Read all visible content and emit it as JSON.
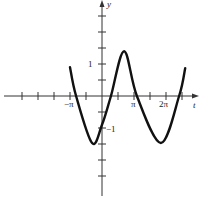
{
  "chart_data": {
    "type": "line",
    "title": "",
    "xlabel": "t",
    "ylabel": "y",
    "x_tick_labels": [
      "-π",
      "π",
      "2π"
    ],
    "y_tick_labels": [
      "1",
      "-1"
    ],
    "x_tick_step": "π/2",
    "y_tick_step": 0.5,
    "xlim_pi": [
      -3,
      3
    ],
    "ylim": [
      -3,
      3
    ],
    "grid": false,
    "legend": null,
    "series": [
      {
        "name": "curve",
        "x_pi": [
          -1.0,
          -0.81,
          -0.31,
          0.0,
          0.28,
          0.69,
          1.09,
          1.84,
          2.41,
          2.6
        ],
        "y": [
          0.9,
          0.0,
          -1.47,
          -0.9,
          0.0,
          1.4,
          0.0,
          -1.47,
          0.0,
          0.87
        ]
      }
    ]
  },
  "axes": {
    "x_label": "t",
    "y_label": "y",
    "labels": {
      "neg_pi": "−π",
      "pi": "π",
      "two_pi": "2π",
      "one": "1",
      "neg_one": "−1"
    }
  },
  "style": {
    "axis_color": "#333333",
    "curve_color": "#111111"
  }
}
